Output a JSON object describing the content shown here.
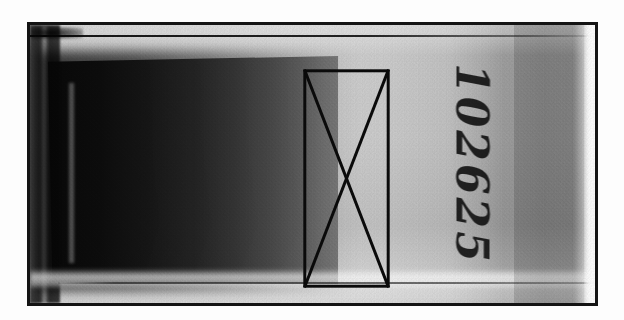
{
  "figure": {
    "kind": "scanned-radiograph-film-strip",
    "caption": "",
    "frame": {
      "border_color": "#141414",
      "border_width_px": 3,
      "left_px": 27,
      "top_px": 22,
      "width_px": 571,
      "height_px": 284
    },
    "background_color": "#ffffff"
  },
  "film": {
    "base_tone_color": "#c9c9c9",
    "dark_wedge": {
      "name": "exposed-dark-wedge",
      "darkest_color": "#070707",
      "lightest_color": "#767676",
      "left_px": 18,
      "top_px": 31,
      "width_px": 290,
      "height_px": 228,
      "gradient_direction": "dark-left-to-light-right"
    },
    "light_field_color": "#cfcfcf",
    "label_panel_color": "#9d9d9d",
    "right_edge_color": "#f2f2f2",
    "registration_line_top_color": "#0d0d0d",
    "registration_line_bottom_color": "#262626",
    "bright_band_bottom_color": "#ffffff"
  },
  "annotation": {
    "name": "rectangle-with-x-marker",
    "shape": "rectangle-with-diagonals",
    "stroke_color": "#0a0a0a",
    "stroke_width_px": 3,
    "left_px": 302,
    "top_px": 69,
    "width_px": 87,
    "height_px": 219
  },
  "handwriting": {
    "name": "handwritten-specimen-id",
    "text": "102625",
    "rotation_degrees": 90,
    "ink_color": "#101010"
  },
  "icons": {
    "x_marker": "x-cross-icon",
    "frame": "film-frame-icon"
  }
}
